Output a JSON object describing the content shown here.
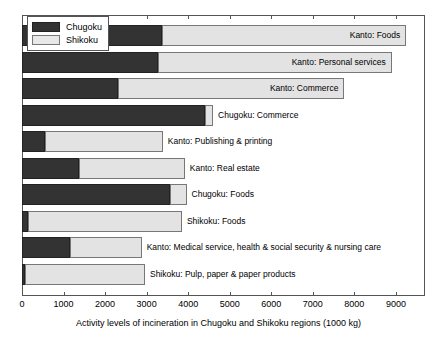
{
  "chart_data": {
    "type": "bar",
    "orientation": "horizontal",
    "stacked": true,
    "title": "",
    "xlabel": "Activity levels of incineration in Chugoku and Shikoku regions (1000 kg)",
    "ylabel": "",
    "xlim": [
      0,
      9700
    ],
    "xticks": [
      0,
      1000,
      2000,
      3000,
      4000,
      5000,
      6000,
      7000,
      8000,
      9000
    ],
    "xticklabels": [
      "0",
      "1000",
      "2000",
      "3000",
      "4000",
      "5000",
      "6000",
      "7000",
      "8000",
      "9000"
    ],
    "grid": false,
    "legend_position": "top-left",
    "legend": [
      "Chugoku",
      "Shikoku"
    ],
    "series": [
      {
        "name": "Chugoku",
        "color": "#333333",
        "values": [
          3370,
          3270,
          2300,
          4400,
          560,
          1370,
          3560,
          150,
          1150,
          80
        ]
      },
      {
        "name": "Shikoku",
        "color": "#e3e3e3",
        "values": [
          5880,
          5630,
          5460,
          200,
          2830,
          2550,
          400,
          3700,
          1730,
          2880
        ]
      }
    ],
    "categories": [
      "Kanto: Foods",
      "Kanto: Personal services",
      "Kanto: Commerce",
      "Chugoku: Commerce",
      "Kanto: Publishing & printing",
      "Kanto: Real estate",
      "Chugoku: Foods",
      "Shikoku: Foods",
      "Kanto: Medical service, health & social security & nursing care",
      "Shikoku: Pulp, paper & paper products"
    ],
    "bar_labels": [
      {
        "text": "Kanto: Foods",
        "placement": "inside"
      },
      {
        "text": "Kanto: Personal services",
        "placement": "inside"
      },
      {
        "text": "Kanto: Commerce",
        "placement": "inside"
      },
      {
        "text": "Chugoku: Commerce",
        "placement": "outside"
      },
      {
        "text": "Kanto: Publishing & printing",
        "placement": "outside"
      },
      {
        "text": "Kanto: Real estate",
        "placement": "outside"
      },
      {
        "text": "Chugoku: Foods",
        "placement": "outside"
      },
      {
        "text": "Shikoku: Foods",
        "placement": "outside"
      },
      {
        "text": "Kanto: Medical service, health & social security & nursing care",
        "placement": "outside"
      },
      {
        "text": "Shikoku: Pulp, paper & paper products",
        "placement": "outside"
      }
    ]
  },
  "legend": {
    "items": [
      {
        "label": "Chugoku",
        "swatch": "dark"
      },
      {
        "label": "Shikoku",
        "swatch": "light"
      }
    ]
  }
}
